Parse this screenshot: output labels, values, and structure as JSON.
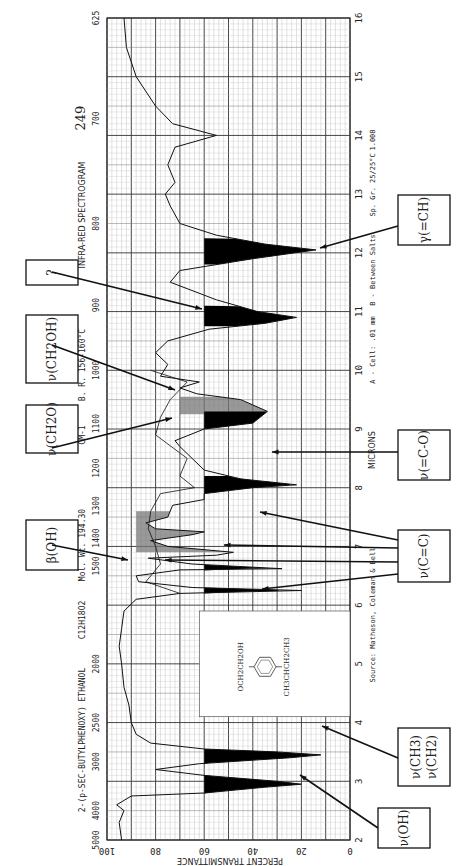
{
  "header": {
    "compound_name": "2-(p-SEC-BUTYLPHENOXY) ETHANOL",
    "formula": "C12H18O2",
    "mol_wt": "Mol. Wt. 194.30",
    "boiling_point": "B. R. 156-160°C",
    "title": "INFRA-RED SPECTROGRAM",
    "spectrum_number": "249",
    "cell_info": "A - Cell: .01 mm",
    "between_salts": "B - Between Salts",
    "sp_gr": "Sp. Gr. 25/25°C",
    "sp_gr_value": "1.008",
    "source": "Source: Matheson, Coleman & Bell",
    "microns_label": "MICRONS",
    "cm_label": "CM-1",
    "y_axis_label": "PERCENT TRANSMITTANCE"
  },
  "structure": {
    "top_group": "OCH2CH2OH",
    "bottom_group": "CH3CHCH2CH3"
  },
  "annotations": [
    {
      "id": "nu-oh",
      "label": "ν(OH)",
      "box": [
        378,
        808,
        52,
        40
      ],
      "arrows": [
        [
          378,
          828,
          300,
          775
        ]
      ]
    },
    {
      "id": "nu-ch3-ch2",
      "label": "ν(CH3) ν(CH2)",
      "box": [
        398,
        728,
        52,
        58
      ],
      "arrows": [
        [
          398,
          758,
          322,
          726
        ]
      ]
    },
    {
      "id": "nu-cc",
      "label": "ν(C=C)",
      "box": [
        398,
        530,
        52,
        52
      ],
      "arrows": [
        [
          398,
          540,
          260,
          512
        ],
        [
          398,
          548,
          224,
          545
        ],
        [
          398,
          562,
          165,
          560
        ],
        [
          398,
          574,
          262,
          589
        ]
      ]
    },
    {
      "id": "nu-c-o",
      "label": "ν(=C-O)",
      "box": [
        398,
        430,
        52,
        50
      ],
      "arrows": [
        [
          398,
          452,
          272,
          452
        ]
      ]
    },
    {
      "id": "beta-oh",
      "label": "β(OH)",
      "box": [
        26,
        520,
        52,
        50
      ],
      "arrows": [
        [
          52,
          545,
          128,
          560
        ]
      ]
    },
    {
      "id": "nu-ch2o",
      "label": "ν(CH2O)",
      "box": [
        26,
        405,
        52,
        48
      ],
      "arrows": [
        [
          52,
          448,
          172,
          418
        ]
      ]
    },
    {
      "id": "nu-ch2oh",
      "label": "ν(CH2OH)",
      "box": [
        26,
        315,
        52,
        68
      ],
      "arrows": [
        [
          52,
          345,
          175,
          390
        ]
      ]
    },
    {
      "id": "unknown",
      "label": "?",
      "box": [
        26,
        260,
        52,
        25
      ],
      "arrows": [
        [
          52,
          272,
          202,
          309
        ]
      ]
    },
    {
      "id": "gamma-ch",
      "label": "γ(=CH)",
      "box": [
        398,
        195,
        52,
        50
      ],
      "arrows": [
        [
          398,
          226,
          320,
          248
        ]
      ]
    }
  ],
  "chart_data": {
    "type": "line",
    "title": "INFRA-RED SPECTROGRAM",
    "subtitle": "2-(p-SEC-BUTYLPHENOXY) ETHANOL",
    "orientation": "rotated 90° (wavelength along vertical, transmittance along horizontal)",
    "xlabel": "MICRONS",
    "ylabel": "PERCENT TRANSMITTANCE",
    "micron_ticks": [
      2,
      3,
      4,
      5,
      6,
      7,
      8,
      9,
      10,
      11,
      12,
      13,
      14,
      15,
      16
    ],
    "wavenumber_ticks": [
      5000,
      4000,
      3000,
      2500,
      2000,
      1500,
      1400,
      1300,
      1200,
      1100,
      1000,
      900,
      800,
      700,
      625
    ],
    "transmittance_ticks": [
      100,
      80,
      60,
      40,
      20,
      0
    ],
    "ylim": [
      0,
      100
    ],
    "xlim_microns": [
      2,
      16
    ],
    "grid": true,
    "series": [
      {
        "name": "A - Cell .01 mm",
        "points_microns_vs_T": [
          [
            2.0,
            94
          ],
          [
            2.3,
            95
          ],
          [
            2.5,
            93
          ],
          [
            2.6,
            96
          ],
          [
            2.75,
            90
          ],
          [
            2.8,
            60
          ],
          [
            2.9,
            35
          ],
          [
            2.95,
            20
          ],
          [
            3.0,
            30
          ],
          [
            3.1,
            60
          ],
          [
            3.2,
            80
          ],
          [
            3.3,
            62
          ],
          [
            3.4,
            25
          ],
          [
            3.45,
            12
          ],
          [
            3.5,
            30
          ],
          [
            3.55,
            60
          ],
          [
            3.65,
            82
          ],
          [
            3.8,
            88
          ],
          [
            4.0,
            90
          ],
          [
            4.3,
            91
          ],
          [
            4.6,
            93
          ],
          [
            5.0,
            94
          ],
          [
            5.3,
            95
          ],
          [
            5.6,
            94
          ],
          [
            5.9,
            93
          ],
          [
            6.1,
            88
          ],
          [
            6.2,
            70
          ],
          [
            6.25,
            20
          ],
          [
            6.3,
            65
          ],
          [
            6.4,
            87
          ],
          [
            6.5,
            88
          ],
          [
            6.6,
            70
          ],
          [
            6.62,
            28
          ],
          [
            6.7,
            65
          ],
          [
            6.8,
            83
          ],
          [
            6.85,
            55
          ],
          [
            6.9,
            48
          ],
          [
            7.0,
            75
          ],
          [
            7.1,
            82
          ],
          [
            7.2,
            65
          ],
          [
            7.25,
            60
          ],
          [
            7.3,
            80
          ],
          [
            7.4,
            84
          ],
          [
            7.5,
            75
          ],
          [
            7.7,
            73
          ],
          [
            7.8,
            60
          ],
          [
            7.9,
            60
          ],
          [
            8.0,
            40
          ],
          [
            8.05,
            22
          ],
          [
            8.15,
            45
          ],
          [
            8.3,
            60
          ],
          [
            8.5,
            65
          ],
          [
            8.7,
            70
          ],
          [
            8.8,
            72
          ],
          [
            9.0,
            60
          ],
          [
            9.1,
            40
          ],
          [
            9.3,
            34
          ],
          [
            9.5,
            45
          ],
          [
            9.6,
            63
          ],
          [
            9.7,
            70
          ],
          [
            9.8,
            62
          ],
          [
            9.9,
            78
          ],
          [
            10.1,
            75
          ],
          [
            10.3,
            80
          ],
          [
            10.5,
            75
          ],
          [
            10.7,
            58
          ],
          [
            10.8,
            35
          ],
          [
            10.9,
            22
          ],
          [
            11.0,
            38
          ],
          [
            11.2,
            55
          ],
          [
            11.5,
            74
          ],
          [
            11.7,
            70
          ],
          [
            11.9,
            40
          ],
          [
            12.05,
            14
          ],
          [
            12.15,
            35
          ],
          [
            12.3,
            55
          ],
          [
            12.5,
            70
          ],
          [
            12.8,
            74
          ],
          [
            13.0,
            76
          ],
          [
            13.2,
            72
          ],
          [
            13.5,
            75
          ],
          [
            13.8,
            72
          ],
          [
            14.0,
            55
          ],
          [
            14.2,
            73
          ],
          [
            14.5,
            80
          ],
          [
            15.0,
            88
          ],
          [
            15.5,
            92
          ],
          [
            16.0,
            93
          ]
        ]
      },
      {
        "name": "B - Between Salts",
        "points_microns_vs_T": [
          [
            6.2,
            70
          ],
          [
            6.4,
            84
          ],
          [
            6.7,
            78
          ],
          [
            7.0,
            80
          ],
          [
            7.3,
            83
          ],
          [
            7.6,
            82
          ],
          [
            7.9,
            78
          ],
          [
            8.0,
            64
          ],
          [
            8.2,
            70
          ],
          [
            8.5,
            67
          ],
          [
            8.9,
            80
          ],
          [
            9.2,
            78
          ],
          [
            9.5,
            74
          ],
          [
            9.8,
            67
          ],
          [
            10.0,
            82
          ]
        ]
      }
    ],
    "shaded_bands": [
      {
        "label": "ν(OH)",
        "microns": [
          2.75,
          3.15
        ],
        "color": "#000000"
      },
      {
        "label": "ν(CH3)/ν(CH2)",
        "microns": [
          3.25,
          3.6
        ],
        "color": "#000000"
      },
      {
        "label": "β(OH)",
        "microns": [
          6.9,
          7.6
        ],
        "color": "#777777"
      },
      {
        "label": "ν(C=C)",
        "microns": [
          6.18,
          6.35
        ],
        "color": "#000000"
      },
      {
        "label": "ν(C=C)",
        "microns": [
          6.55,
          6.75
        ],
        "color": "#000000"
      },
      {
        "label": "ν(=C-O)",
        "microns": [
          7.9,
          8.2
        ],
        "color": "#000000"
      },
      {
        "label": "ν(CH2O)",
        "microns": [
          9.25,
          9.55
        ],
        "color": "#777777"
      },
      {
        "label": "ν(CH2OH)",
        "microns": [
          9.0,
          9.3
        ],
        "color": "#000000"
      },
      {
        "label": "?",
        "microns": [
          10.75,
          11.1
        ],
        "color": "#000000"
      },
      {
        "label": "γ(=CH)",
        "microns": [
          11.8,
          12.25
        ],
        "color": "#000000"
      }
    ]
  }
}
